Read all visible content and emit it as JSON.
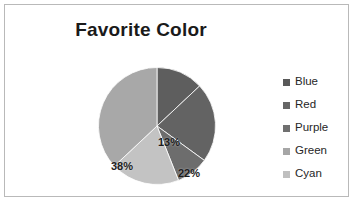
{
  "chart_data": {
    "type": "pie",
    "title": "Favorite Color",
    "xlabel": "",
    "ylabel": "",
    "grid": false,
    "legend_position": "right",
    "categories": [
      "Blue",
      "Red",
      "Purple",
      "Green",
      "Cyan"
    ],
    "values": [
      13,
      22,
      9,
      38,
      19
    ],
    "data_labels": [
      "13%",
      "22%",
      "9%",
      "38%",
      "19%"
    ],
    "units": "percent",
    "slice_order_clockwise_from_top": [
      "Blue",
      "Red",
      "Purple",
      "Cyan",
      "Green"
    ],
    "slice_colors": [
      "#5e5e5e",
      "#636363",
      "#6d6d6d",
      "#c3c3c3",
      "#a8a8a8"
    ],
    "slices": [
      {
        "label": "Blue",
        "value": 13,
        "data_label": "13%",
        "color": "#5e5e5e",
        "start_deg": 0,
        "end_deg": 46.8,
        "label_outside": false
      },
      {
        "label": "Red",
        "value": 22,
        "data_label": "22%",
        "color": "#636363",
        "start_deg": 46.8,
        "end_deg": 126.0,
        "label_outside": false
      },
      {
        "label": "Purple",
        "value": 9,
        "data_label": "9%",
        "color": "#6d6d6d",
        "start_deg": 126.0,
        "end_deg": 158.4,
        "label_outside": true
      },
      {
        "label": "Cyan",
        "value": 19,
        "data_label": "19%",
        "color": "#c3c3c3",
        "start_deg": 158.4,
        "end_deg": 226.8,
        "label_outside": false
      },
      {
        "label": "Green",
        "value": 38,
        "data_label": "38%",
        "color": "#a8a8a8",
        "start_deg": 226.8,
        "end_deg": 360.0,
        "label_outside": false
      }
    ]
  },
  "chart": {
    "title": "Favorite Color"
  },
  "legend": {
    "items": [
      {
        "label": "Blue",
        "color": "#595959"
      },
      {
        "label": "Red",
        "color": "#666666"
      },
      {
        "label": "Purple",
        "color": "#707070"
      },
      {
        "label": "Green",
        "color": "#a6a6a6"
      },
      {
        "label": "Cyan",
        "color": "#bfbfbf"
      }
    ]
  },
  "labels": {
    "blue": "13%",
    "red": "22%",
    "purple": "9%",
    "cyan": "19%",
    "green": "38%"
  },
  "colors": {
    "border": "#b9b9b9",
    "background": "#ffffff",
    "text": "#262626",
    "title": "#1a1a1a"
  }
}
